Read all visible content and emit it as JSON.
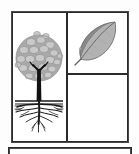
{
  "figure": {
    "title": "Tree and leaf diagram panel",
    "caption": "",
    "background_color": "#fdfdfd",
    "ink_color": "#2b2b2b"
  },
  "main_panel": {
    "name": "main-panel",
    "border_color": "#2b2b2b",
    "border_width_px": 2,
    "x": 11,
    "y": 11,
    "width": 118,
    "height": 132,
    "fill": "#ffffff"
  },
  "dividers": {
    "vertical_x": 67,
    "horizontal_y": 74,
    "color": "#2b2b2b",
    "width_px": 2
  },
  "cells": [
    {
      "id": "cell-tree",
      "label": "tree-with-roots",
      "position": "left",
      "content": "tree"
    },
    {
      "id": "cell-leaf",
      "label": "leaf",
      "position": "top-right",
      "content": "leaf"
    },
    {
      "id": "cell-empty",
      "label": "empty-cell",
      "position": "bottom-right",
      "content": "empty"
    }
  ],
  "tree": {
    "name": "tree-illustration",
    "crown": {
      "name": "tree-crown",
      "shape": "circle",
      "center_x": 39,
      "center_y": 58,
      "radius": 23,
      "fill": "#a9a9a9",
      "blob_fill": "#c9c9c9",
      "blob_stroke": "#8f8f8f"
    },
    "trunk": {
      "name": "tree-trunk",
      "fill": "#111111",
      "top_y": 72,
      "bottom_y": 101,
      "x": 39
    },
    "ground_line": {
      "name": "ground-line",
      "y": 101,
      "x1": 15,
      "x2": 63,
      "color": "#1a1a1a"
    },
    "roots": {
      "name": "root-system",
      "color": "#1a1a1a",
      "spread_x1": 14,
      "spread_x2": 64,
      "depth_y": 124
    }
  },
  "leaf": {
    "name": "leaf-illustration",
    "center_x": 99,
    "center_y": 44,
    "dark_half_fill": "#888888",
    "light_half_fill": "#b2b2b2",
    "outline_color": "#6e6e6e",
    "midrib_color": "#6a6a6a",
    "stem_color": "#5f5f5f",
    "tip_direction": "upper-right",
    "stem_direction": "lower-left"
  },
  "lower_panel": {
    "name": "lower-panel-edge",
    "x": 9,
    "y": 148,
    "width": 122,
    "height": 6,
    "border_color": "#2b2b2b",
    "border_width_px": 2
  }
}
